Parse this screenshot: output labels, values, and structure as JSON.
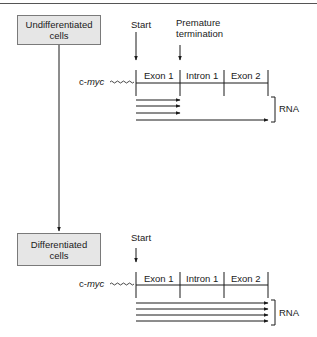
{
  "diagram": {
    "title": "",
    "states": [
      {
        "id": "undifferentiated",
        "box_label_line1": "Undifferentiated",
        "box_label_line2": "cells",
        "gene": {
          "prefix": "c-",
          "name": "myc"
        },
        "markers": [
          {
            "label": "Start"
          },
          {
            "label_line1": "Premature",
            "label_line2": "termination"
          }
        ],
        "segments": [
          "Exon 1",
          "Intron 1",
          "Exon 2"
        ],
        "rna_label": "RNA",
        "transcripts": [
          {
            "end": "Exon 1",
            "type": "premature"
          },
          {
            "end": "Exon 1",
            "type": "premature"
          },
          {
            "end": "Exon 1",
            "type": "premature"
          },
          {
            "end": "Exon 2",
            "type": "full-length"
          }
        ]
      },
      {
        "id": "differentiated",
        "box_label_line1": "Differentiated",
        "box_label_line2": "cells",
        "gene": {
          "prefix": "c-",
          "name": "myc"
        },
        "markers": [
          {
            "label": "Start"
          }
        ],
        "segments": [
          "Exon 1",
          "Intron 1",
          "Exon 2"
        ],
        "rna_label": "RNA",
        "transcripts": [
          {
            "end": "Exon 2",
            "type": "full-length"
          },
          {
            "end": "Exon 2",
            "type": "full-length"
          },
          {
            "end": "Exon 2",
            "type": "full-length"
          },
          {
            "end": "Exon 2",
            "type": "full-length"
          }
        ]
      }
    ],
    "transition": {
      "from": "undifferentiated",
      "to": "differentiated"
    }
  }
}
